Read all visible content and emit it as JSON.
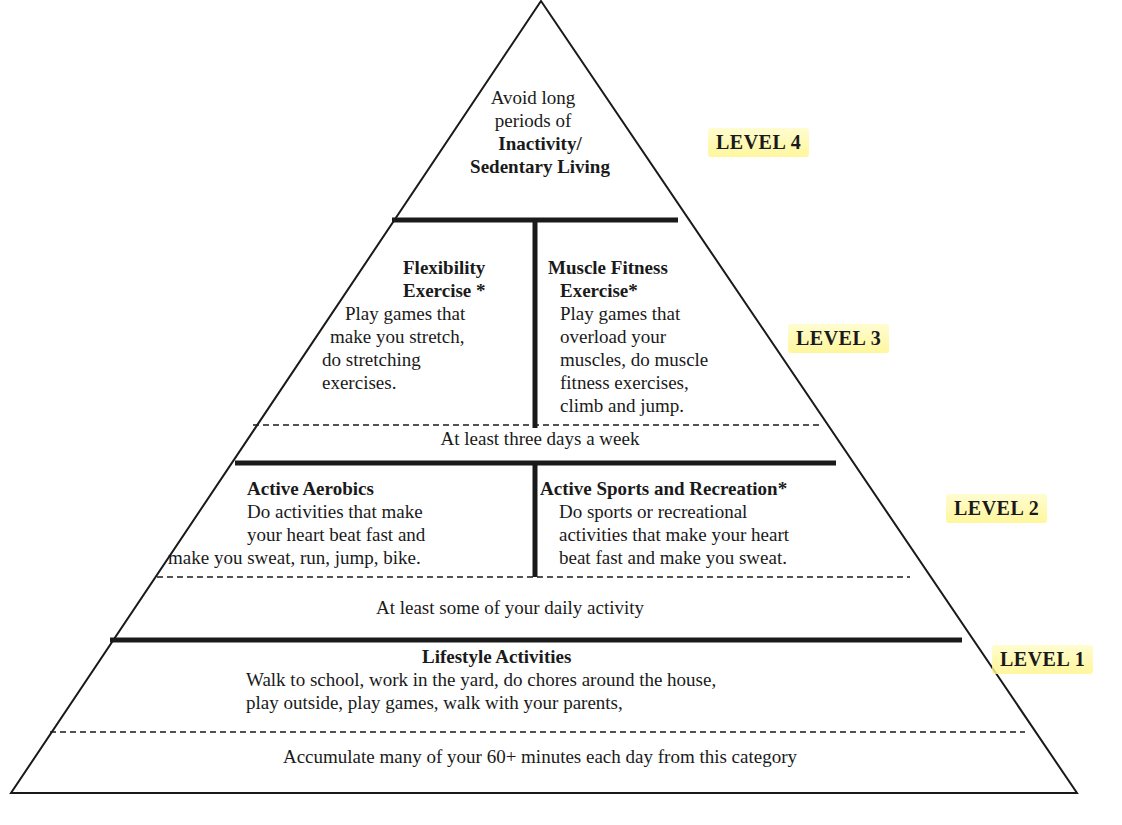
{
  "colors": {
    "ink": "#1a1a1a",
    "highlight": "#fff59a",
    "background": "#ffffff"
  },
  "pyramid": {
    "level4": {
      "label": "LEVEL 4",
      "lines": [
        "Avoid long",
        "periods of"
      ],
      "bold_lines": [
        "Inactivity/",
        "Sedentary Living"
      ]
    },
    "level3": {
      "label": "LEVEL 3",
      "left": {
        "title_lines": [
          "Flexibility",
          "Exercise *"
        ],
        "body_lines": [
          "Play games that",
          "make you stretch,",
          "do stretching",
          "exercises."
        ]
      },
      "right": {
        "title_lines": [
          "Muscle Fitness",
          "Exercise*"
        ],
        "body_lines": [
          "Play games that",
          "overload your",
          "muscles, do muscle",
          "fitness exercises,",
          "climb and jump."
        ]
      },
      "frequency": "At least three days a week"
    },
    "level2": {
      "label": "LEVEL 2",
      "left": {
        "title": "Active Aerobics",
        "body_lines": [
          "Do activities that make",
          "your heart beat fast and",
          "make you sweat, run, jump, bike."
        ]
      },
      "right": {
        "title": "Active Sports and Recreation*",
        "body_lines": [
          "Do sports or recreational",
          "activities that make your heart",
          "beat fast and make you sweat."
        ]
      },
      "frequency": "At least some of your daily activity"
    },
    "level1": {
      "label": "LEVEL 1",
      "title": "Lifestyle Activities",
      "body_lines": [
        "Walk to school, work in the yard, do chores around the house,",
        "play outside, play games, walk with your parents,"
      ],
      "frequency": "Accumulate many of your 60+ minutes each day from this category"
    }
  }
}
